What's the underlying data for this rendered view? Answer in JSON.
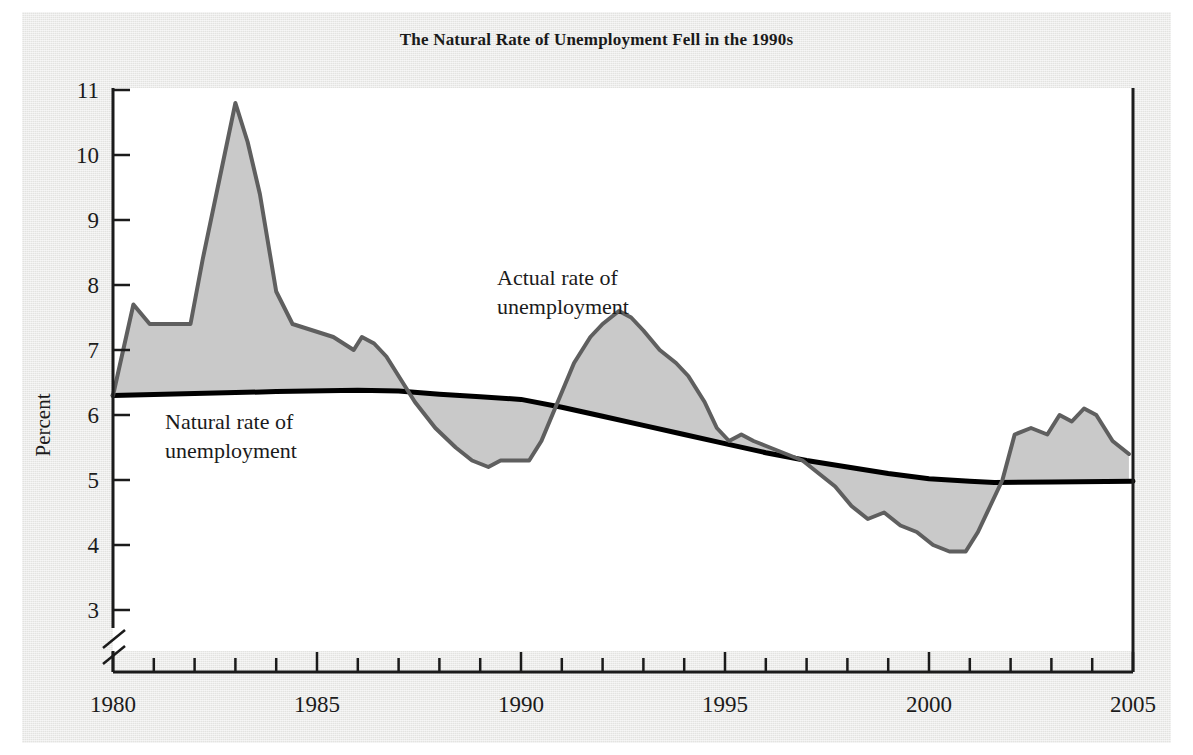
{
  "figure": {
    "title": "The Natural Rate of Unemployment Fell in the 1990s",
    "background_color": "#e3e3e1",
    "plot_background_color": "#ffffff"
  },
  "annotations": {
    "actual": {
      "line1": "Actual rate of",
      "line2": "unemployment"
    },
    "natural": {
      "line1": "Natural rate of",
      "line2": "unemployment"
    }
  },
  "axes": {
    "y_label": "Percent",
    "y_ticks": [
      "3",
      "4",
      "5",
      "6",
      "7",
      "8",
      "9",
      "10",
      "11"
    ],
    "x_ticks": [
      "1980",
      "1985",
      "1990",
      "1995",
      "2000",
      "2005"
    ],
    "y_axis_break": true
  },
  "chart_data": {
    "type": "area",
    "title": "The Natural Rate of Unemployment Fell in the 1990s",
    "xlabel": "",
    "ylabel": "Percent",
    "xlim": [
      1980,
      2005
    ],
    "ylim": [
      2.6,
      11
    ],
    "ytick_values": [
      3,
      4,
      5,
      6,
      7,
      8,
      9,
      10,
      11
    ],
    "xtick_values": [
      1980,
      1985,
      1990,
      1995,
      2000,
      2005
    ],
    "xtick_labeled": [
      1980,
      1985,
      1990,
      1995,
      2000,
      2005
    ],
    "xtick_minor_every": 1,
    "grid": false,
    "legend": "inline annotations",
    "y_axis_break_below": 3,
    "fill_between": {
      "series_a": "Actual rate of unemployment",
      "series_b": "Natural rate of unemployment",
      "fill_color": "#c9c9c9",
      "description": "Gray shading between the actual unemployment rate and the natural rate"
    },
    "series": [
      {
        "name": "Actual rate of unemployment",
        "color": "#5f5f5f",
        "line_width": 4,
        "x": [
          1980.0,
          1980.5,
          1980.9,
          1981.3,
          1981.9,
          1982.2,
          1982.6,
          1983.0,
          1983.3,
          1983.6,
          1984.0,
          1984.4,
          1984.9,
          1985.4,
          1985.9,
          1986.1,
          1986.4,
          1986.7,
          1987.0,
          1987.4,
          1987.9,
          1988.4,
          1988.8,
          1989.2,
          1989.5,
          1989.9,
          1990.2,
          1990.5,
          1990.9,
          1991.3,
          1991.7,
          1992.0,
          1992.4,
          1992.7,
          1993.0,
          1993.4,
          1993.8,
          1994.1,
          1994.5,
          1994.8,
          1995.1,
          1995.4,
          1995.7,
          1996.1,
          1996.5,
          1996.9,
          1997.3,
          1997.7,
          1998.1,
          1998.5,
          1998.9,
          1999.3,
          1999.7,
          2000.1,
          2000.5,
          2000.9,
          2001.2,
          2001.5,
          2001.8,
          2002.1,
          2002.5,
          2002.9,
          2003.2,
          2003.5,
          2003.8,
          2004.1,
          2004.5,
          2004.9
        ],
        "y": [
          6.3,
          7.7,
          7.4,
          7.4,
          7.4,
          8.4,
          9.6,
          10.8,
          10.2,
          9.4,
          7.9,
          7.4,
          7.3,
          7.2,
          7.0,
          7.2,
          7.1,
          6.9,
          6.6,
          6.2,
          5.8,
          5.5,
          5.3,
          5.2,
          5.3,
          5.3,
          5.3,
          5.6,
          6.2,
          6.8,
          7.2,
          7.4,
          7.6,
          7.5,
          7.3,
          7.0,
          6.8,
          6.6,
          6.2,
          5.8,
          5.6,
          5.7,
          5.6,
          5.5,
          5.4,
          5.3,
          5.1,
          4.9,
          4.6,
          4.4,
          4.5,
          4.3,
          4.2,
          4.0,
          3.9,
          3.9,
          4.2,
          4.6,
          5.0,
          5.7,
          5.8,
          5.7,
          6.0,
          5.9,
          6.1,
          6.0,
          5.6,
          5.4
        ]
      },
      {
        "name": "Natural rate of unemployment",
        "color": "#000000",
        "line_width": 5,
        "x": [
          1980.0,
          1982.0,
          1984.0,
          1986.0,
          1987.0,
          1988.0,
          1989.0,
          1990.0,
          1991.0,
          1992.0,
          1993.0,
          1994.0,
          1995.0,
          1996.0,
          1997.0,
          1998.0,
          1999.0,
          2000.0,
          2001.0,
          2001.6,
          2003.0,
          2005.0
        ],
        "y": [
          6.3,
          6.33,
          6.36,
          6.38,
          6.37,
          6.32,
          6.28,
          6.24,
          6.12,
          5.98,
          5.84,
          5.7,
          5.56,
          5.42,
          5.3,
          5.2,
          5.1,
          5.02,
          4.98,
          4.96,
          4.97,
          4.98
        ]
      }
    ]
  }
}
